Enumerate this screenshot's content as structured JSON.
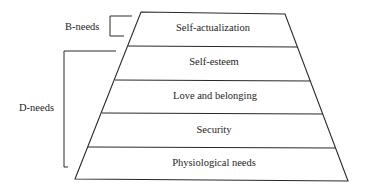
{
  "diagram": {
    "levels": [
      {
        "label": "Self-actualization"
      },
      {
        "label": "Self-esteem"
      },
      {
        "label": "Love and belonging"
      },
      {
        "label": "Security"
      },
      {
        "label": "Physiological needs"
      }
    ],
    "groups": [
      {
        "label": "B-needs",
        "covers": [
          "Self-actualization"
        ]
      },
      {
        "label": "D-needs",
        "covers": [
          "Self-esteem",
          "Love and belonging",
          "Security",
          "Physiological needs"
        ]
      }
    ],
    "colors": {
      "line": "#2a2a2a",
      "background": "#ffffff"
    }
  }
}
